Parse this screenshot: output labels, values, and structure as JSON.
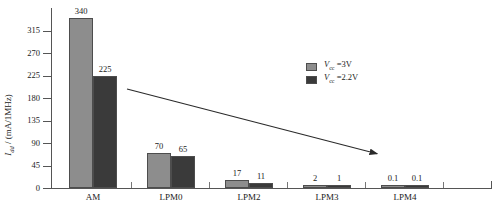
{
  "chart_data": {
    "type": "bar",
    "title": "",
    "xlabel": "",
    "ylabel": "I_dd / (mA/1MHz)",
    "ylabel_main": "I",
    "ylabel_sub": "dd",
    "ylabel_unit": " / (mA/1MHz)",
    "categories": [
      "AM",
      "LPM0",
      "LPM2",
      "LPM3",
      "LPM4"
    ],
    "ylim": [
      0,
      360
    ],
    "yticks": [
      0,
      45,
      90,
      135,
      180,
      225,
      270,
      315
    ],
    "grid": false,
    "legend_position": "top-right",
    "series": [
      {
        "name": "Vcc =3V",
        "name_main": "V",
        "name_sub": "cc",
        "name_rest": " =3V",
        "color": "#8d8d8d",
        "values": [
          340,
          70,
          17,
          2,
          0.1
        ],
        "labels": [
          "340",
          "70",
          "17",
          "2",
          "0.1"
        ]
      },
      {
        "name": "Vcc =2.2V",
        "name_main": "V",
        "name_sub": "cc",
        "name_rest": " =2.2V",
        "color": "#3a3a3a",
        "values": [
          225,
          65,
          11,
          1,
          0.1
        ],
        "labels": [
          "225",
          "65",
          "11",
          "1",
          "0.1"
        ]
      }
    ],
    "annotations": [
      {
        "type": "arrow",
        "name": "decreasing-current-trend-arrow",
        "x1": 127,
        "y1": 89,
        "x2": 382,
        "y2": 155
      }
    ]
  },
  "caption": {
    "text": ""
  }
}
